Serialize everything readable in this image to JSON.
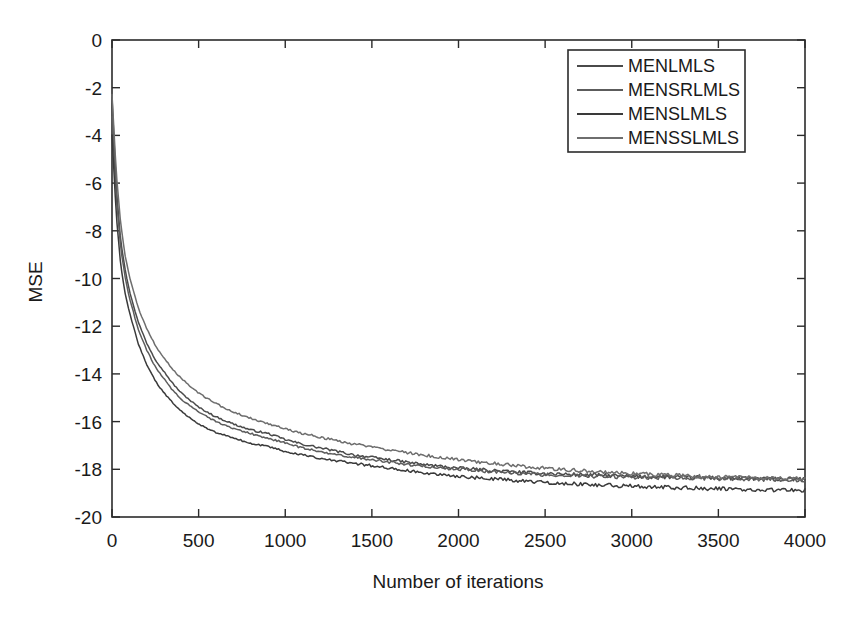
{
  "chart_data": {
    "type": "line",
    "title": "",
    "xlabel": "Number of iterations",
    "ylabel": "MSE",
    "xlim": [
      0,
      4000
    ],
    "ylim": [
      -20,
      0
    ],
    "xticks": [
      0,
      500,
      1000,
      1500,
      2000,
      2500,
      3000,
      3500,
      4000
    ],
    "xtick_labels": [
      "0",
      "500",
      "1000",
      "1500",
      "2000",
      "2500",
      "3000",
      "3500",
      "4000"
    ],
    "yticks": [
      0,
      -2,
      -4,
      -6,
      -8,
      -10,
      -12,
      -14,
      -16,
      -18,
      -20
    ],
    "ytick_labels": [
      "0",
      "-2",
      "-4",
      "-6",
      "-8",
      "-10",
      "-12",
      "-14",
      "-16",
      "-18",
      "-20"
    ],
    "grid": false,
    "legend_position": "top-right",
    "x": [
      0,
      25,
      50,
      75,
      100,
      150,
      200,
      250,
      300,
      350,
      400,
      450,
      500,
      600,
      700,
      800,
      900,
      1000,
      1100,
      1200,
      1300,
      1400,
      1500,
      1600,
      1700,
      1800,
      2000,
      2200,
      2400,
      2600,
      2800,
      3000,
      3200,
      3400,
      3600,
      3800,
      4000
    ],
    "series": [
      {
        "name": "MENLMLS",
        "color": "#4a4a4a",
        "values": [
          -2.4,
          -6.2,
          -8.4,
          -9.6,
          -10.5,
          -11.8,
          -12.7,
          -13.4,
          -13.9,
          -14.4,
          -14.8,
          -15.1,
          -15.4,
          -15.8,
          -16.1,
          -16.35,
          -16.5,
          -16.75,
          -16.95,
          -17.1,
          -17.25,
          -17.4,
          -17.5,
          -17.6,
          -17.7,
          -17.8,
          -17.95,
          -18.05,
          -18.15,
          -18.2,
          -18.25,
          -18.3,
          -18.32,
          -18.35,
          -18.38,
          -18.4,
          -18.42
        ]
      },
      {
        "name": "MENSRLMLS",
        "color": "#5c5c5c",
        "values": [
          -3.2,
          -6.6,
          -8.7,
          -9.9,
          -10.8,
          -12.1,
          -13.0,
          -13.7,
          -14.2,
          -14.7,
          -15.05,
          -15.35,
          -15.6,
          -16.0,
          -16.3,
          -16.5,
          -16.7,
          -16.9,
          -17.1,
          -17.25,
          -17.4,
          -17.5,
          -17.6,
          -17.7,
          -17.8,
          -17.88,
          -18.0,
          -18.1,
          -18.2,
          -18.25,
          -18.3,
          -18.32,
          -18.35,
          -18.38,
          -18.4,
          -18.42,
          -18.45
        ]
      },
      {
        "name": "MENSLMLS",
        "color": "#3a3a3a",
        "values": [
          -4.0,
          -7.4,
          -9.4,
          -10.6,
          -11.4,
          -12.7,
          -13.6,
          -14.3,
          -14.8,
          -15.2,
          -15.55,
          -15.85,
          -16.1,
          -16.45,
          -16.7,
          -16.9,
          -17.05,
          -17.25,
          -17.4,
          -17.55,
          -17.65,
          -17.75,
          -17.85,
          -17.95,
          -18.05,
          -18.15,
          -18.3,
          -18.4,
          -18.5,
          -18.58,
          -18.65,
          -18.7,
          -18.75,
          -18.8,
          -18.83,
          -18.86,
          -18.9
        ]
      },
      {
        "name": "MENSSLMLS",
        "color": "#6e6e6e",
        "values": [
          -2.3,
          -5.6,
          -7.7,
          -9.0,
          -9.9,
          -11.2,
          -12.1,
          -12.8,
          -13.35,
          -13.8,
          -14.2,
          -14.5,
          -14.8,
          -15.25,
          -15.6,
          -15.85,
          -16.1,
          -16.3,
          -16.5,
          -16.65,
          -16.8,
          -16.95,
          -17.05,
          -17.2,
          -17.3,
          -17.4,
          -17.6,
          -17.75,
          -17.9,
          -18.0,
          -18.1,
          -18.18,
          -18.25,
          -18.3,
          -18.34,
          -18.38,
          -18.4
        ]
      }
    ]
  },
  "legend": {
    "items": [
      {
        "label": "MENLMLS"
      },
      {
        "label": "MENSRLMLS"
      },
      {
        "label": "MENSLMLS"
      },
      {
        "label": "MENSSLMLS"
      }
    ]
  },
  "colors": {
    "axis": "#2b2b2b",
    "background": "#ffffff",
    "text": "#1a1a1a"
  }
}
